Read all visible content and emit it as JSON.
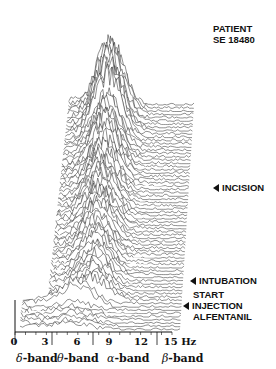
{
  "chart_data": {
    "type": "waterfall-line",
    "title": "PATIENT SE 18480",
    "xlabel": "Hz",
    "x_ticks": [
      0,
      3,
      6,
      9,
      12,
      15
    ],
    "x_tick_labels": [
      "0",
      "3",
      "6",
      "9",
      "12",
      "15 Hz"
    ],
    "xlim": [
      0,
      15
    ],
    "bands": [
      {
        "symbol": "δ",
        "label": "-band",
        "range": "0-3"
      },
      {
        "symbol": "θ",
        "label": "-band",
        "range": "3-7"
      },
      {
        "symbol": "α",
        "label": "-band",
        "range": "7-13"
      },
      {
        "symbol": "β",
        "label": "-band",
        "range": "13-15"
      }
    ],
    "annotations": [
      {
        "text": "INCISION",
        "approx_trace_fraction_from_bottom": 0.55
      },
      {
        "text": "INTUBATION",
        "approx_trace_fraction_from_bottom": 0.13
      },
      {
        "text": "START INJECTION ALFENTANIL",
        "approx_trace_fraction_from_bottom": 0.03
      }
    ],
    "grid": false,
    "legend": null
  },
  "header": {
    "line1": "PATIENT",
    "line2": "SE 18480"
  },
  "events": {
    "incision": "INCISION",
    "intubation": "INTUBATION",
    "start": "START",
    "injection": "INJECTION",
    "alfentanil": "ALFENTANIL"
  },
  "axis": {
    "t0": "0",
    "t3": "3",
    "t6": "6",
    "t9": "9",
    "t12": "12",
    "t15": "15 Hz"
  },
  "bands": {
    "delta_sym": "δ",
    "theta_sym": "θ",
    "alpha_sym": "α",
    "beta_sym": "β",
    "suffix": "-band"
  }
}
